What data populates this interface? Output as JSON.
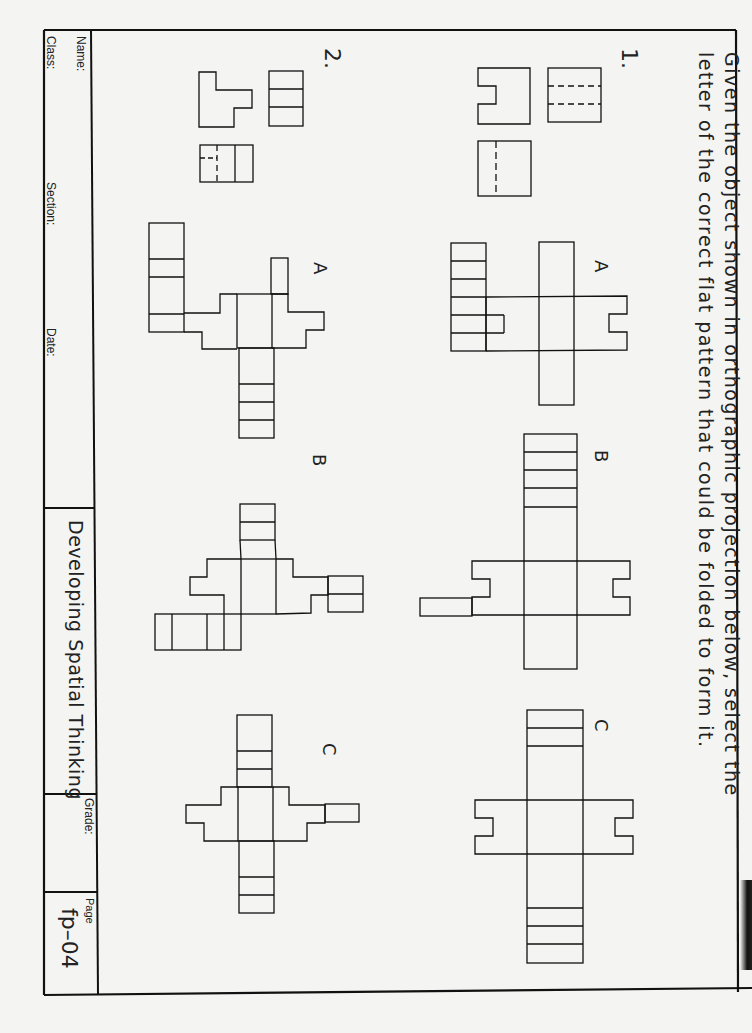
{
  "instructions": {
    "line1": "Given the object shown in orthographic projection below, select the",
    "line2": "letter of the correct flat pattern that could be folded to form it."
  },
  "problems": [
    {
      "number": "1.",
      "views": [
        "front-view-notched",
        "top-view-two-hidden-lines",
        "side-view-one-hidden-line"
      ],
      "options": [
        {
          "letter": "A"
        },
        {
          "letter": "B"
        },
        {
          "letter": "C"
        }
      ]
    },
    {
      "number": "2.",
      "views": [
        "top-view-three-sections",
        "front-view-stepped",
        "side-view-hidden-line"
      ],
      "options": [
        {
          "letter": "A"
        },
        {
          "letter": "B"
        },
        {
          "letter": "C"
        }
      ]
    }
  ],
  "title_block": {
    "name_label": "Name:",
    "class_label": "Class:",
    "section_label": "Section:",
    "date_label": "Date:",
    "course_title": "Developing Spatial Thinking",
    "grade_label": "Grade:",
    "page_label": "Page",
    "page_number": "fp–04"
  },
  "colors": {
    "paper": "#f4f4f2",
    "ink": "#111111"
  }
}
